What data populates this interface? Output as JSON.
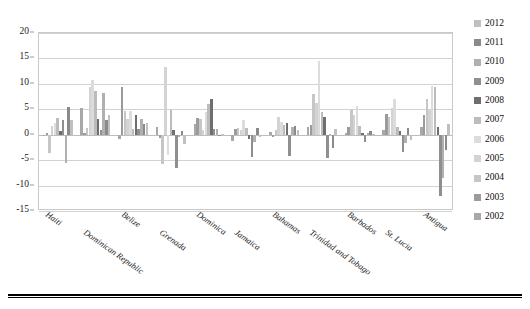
{
  "chart_data": {
    "type": "bar",
    "title": "",
    "subtitle": "",
    "xlabel": "",
    "ylabel": "",
    "ylim": [
      -15,
      20
    ],
    "yticks": [
      20,
      15,
      10,
      5,
      0,
      -5,
      -10,
      -15
    ],
    "grid": true,
    "legend_position": "right",
    "categories": [
      "Haiti",
      "Dominican Republic",
      "Belize",
      "Grenada",
      "Dominica",
      "Jamaica",
      "Bahamas",
      "Trinidad and Tobago",
      "Barbados",
      "St. Lucia",
      "Antigua"
    ],
    "series": [
      {
        "name": "2002",
        "color": "#a8a8a8",
        "values": [
          -0.3,
          5.2,
          -0.9,
          1.6,
          2.1,
          -1.2,
          0.6,
          1.5,
          0.4,
          0.9,
          1.5
        ]
      },
      {
        "name": "2003",
        "color": "#9b9b9b",
        "values": [
          0.4,
          0.3,
          9.3,
          -0.6,
          3.2,
          1.1,
          -0.5,
          2.0,
          1.6,
          4.0,
          3.8
        ]
      },
      {
        "name": "2004",
        "color": "#c6c6c6",
        "values": [
          -3.5,
          1.3,
          4.6,
          -5.7,
          3.0,
          1.4,
          0.9,
          8.0,
          4.9,
          3.5,
          7.0
        ]
      },
      {
        "name": "2005",
        "color": "#d3d3d3",
        "values": [
          1.8,
          9.3,
          3.0,
          13.3,
          1.0,
          1.0,
          3.4,
          6.2,
          3.9,
          5.2,
          5.0
        ]
      },
      {
        "name": "2006",
        "color": "#dcdcdc",
        "values": [
          2.3,
          10.7,
          4.7,
          -4.0,
          4.5,
          2.9,
          2.5,
          14.4,
          5.7,
          7.0,
          9.5
        ]
      },
      {
        "name": "2007",
        "color": "#bcbcbc",
        "values": [
          3.3,
          8.5,
          1.2,
          4.9,
          6.0,
          1.4,
          1.9,
          4.5,
          1.7,
          1.5,
          9.3
        ]
      },
      {
        "name": "2008",
        "color": "#6e6e6e",
        "values": [
          0.8,
          3.1,
          3.8,
          0.9,
          7.1,
          -0.8,
          2.4,
          3.4,
          0.3,
          0.8,
          1.5
        ]
      },
      {
        "name": "2009",
        "color": "#8f8f8f",
        "values": [
          2.9,
          0.9,
          1.1,
          -6.6,
          1.1,
          -4.4,
          -4.2,
          -4.5,
          -1.5,
          -3.4,
          -12.0
        ]
      },
      {
        "name": "2010",
        "color": "#b0b0b0",
        "values": [
          -5.5,
          8.3,
          3.1,
          -0.5,
          1.2,
          -1.5,
          1.5,
          0.2,
          0.3,
          -1.7,
          -8.5
        ]
      },
      {
        "name": "2011",
        "color": "#8a8a8a",
        "values": [
          5.5,
          2.9,
          2.1,
          0.8,
          -0.2,
          1.4,
          1.7,
          -2.6,
          0.8,
          1.4,
          -3.0
        ]
      },
      {
        "name": "2012",
        "color": "#c0c0c0",
        "values": [
          2.9,
          3.9,
          2.3,
          -1.8,
          0.2,
          -0.5,
          1.0,
          1.2,
          0.2,
          -1.1,
          2.2
        ]
      }
    ],
    "legend_entries": [
      {
        "label": "2012",
        "color": "#c0c0c0"
      },
      {
        "label": "2011",
        "color": "#8a8a8a"
      },
      {
        "label": "2010",
        "color": "#b0b0b0"
      },
      {
        "label": "2009",
        "color": "#8f8f8f"
      },
      {
        "label": "2008",
        "color": "#6e6e6e"
      },
      {
        "label": "2007",
        "color": "#bcbcbc"
      },
      {
        "label": "2006",
        "color": "#dcdcdc"
      },
      {
        "label": "2005",
        "color": "#d3d3d3"
      },
      {
        "label": "2004",
        "color": "#c6c6c6"
      },
      {
        "label": "2003",
        "color": "#9b9b9b"
      },
      {
        "label": "2002",
        "color": "#a8a8a8"
      }
    ]
  }
}
